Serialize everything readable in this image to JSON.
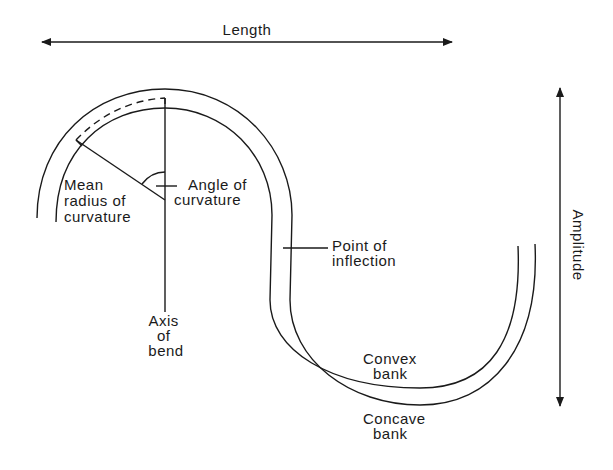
{
  "diagram": {
    "type": "meander-geometry",
    "colors": {
      "ink": "#1a1a1a",
      "background": "#ffffff"
    },
    "dimensions": {
      "length": {
        "label": "Length",
        "orientation": "horizontal"
      },
      "amplitude": {
        "label": "Amplitude",
        "orientation": "vertical"
      }
    },
    "labels": {
      "mean_radius": [
        "Mean",
        "radius of",
        "curvature"
      ],
      "angle": [
        "Angle of",
        "curvature"
      ],
      "inflection": [
        "Point of",
        "inflection"
      ],
      "axis": [
        "Axis",
        "of",
        "bend"
      ],
      "convex": [
        "Convex",
        "bank"
      ],
      "concave": [
        "Concave",
        "bank"
      ]
    }
  }
}
